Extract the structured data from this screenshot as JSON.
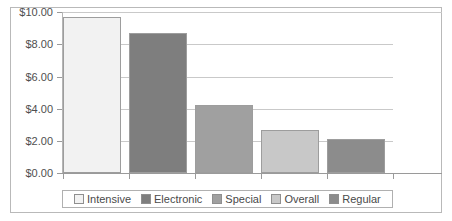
{
  "chart_data": {
    "type": "bar",
    "title": "",
    "xlabel": "",
    "ylabel": "",
    "categories": [
      "Intensive",
      "Electronic",
      "Special",
      "Overall",
      "Regular"
    ],
    "values": [
      9.7,
      8.7,
      4.25,
      2.65,
      2.1
    ],
    "ylim": [
      0,
      10
    ],
    "ytick_labels": [
      "$10.00",
      "$8.00",
      "$6.00",
      "$4.00",
      "$2.00",
      "$0.00"
    ],
    "ytick_values": [
      10,
      8,
      6,
      4,
      2,
      0
    ],
    "grid": true,
    "legend_position": "bottom",
    "series": [
      {
        "name": "Intensive",
        "value": 9.7,
        "color": "#f2f2f2"
      },
      {
        "name": "Electronic",
        "value": 8.7,
        "color": "#7e7e7e"
      },
      {
        "name": "Special",
        "value": 4.25,
        "color": "#a0a0a0"
      },
      {
        "name": "Overall",
        "value": 2.65,
        "color": "#c8c8c8"
      },
      {
        "name": "Regular",
        "value": 2.1,
        "color": "#8c8c8c"
      }
    ]
  },
  "legend": {
    "items": [
      {
        "label": "Intensive",
        "color": "#f2f2f2"
      },
      {
        "label": "Electronic",
        "color": "#7e7e7e"
      },
      {
        "label": "Special",
        "color": "#a0a0a0"
      },
      {
        "label": "Overall",
        "color": "#c8c8c8"
      },
      {
        "label": "Regular",
        "color": "#8c8c8c"
      }
    ]
  }
}
